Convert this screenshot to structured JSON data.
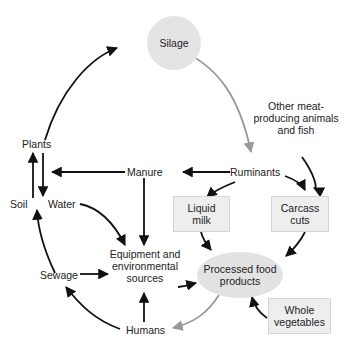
{
  "nodes": {
    "silage": "Silage",
    "other_animals": "Other meat-\nproducing animals\nand fish",
    "plants": "Plants",
    "manure": "Manure",
    "ruminants": "Ruminants",
    "soil": "Soil",
    "water": "Water",
    "liquid_milk": "Liquid\nmilk",
    "carcass_cuts": "Carcass\ncuts",
    "equipment": "Equipment and\nenvironmental\nsources",
    "sewage": "Sewage",
    "processed_food": "Processed food\nproducts",
    "whole_vegetables": "Whole\nvegetables",
    "humans": "Humans"
  },
  "colors": {
    "arrow_dark": "#111111",
    "arrow_gray": "#999999",
    "node_fill": "#e4e4e4",
    "box_fill": "#eeeeee"
  },
  "edges": [
    {
      "from": "Plants",
      "to": "Silage",
      "style": "dark"
    },
    {
      "from": "Silage",
      "to": "Ruminants",
      "style": "gray"
    },
    {
      "from": "Other meat-producing animals and fish",
      "to": "Carcass cuts",
      "style": "dark"
    },
    {
      "from": "Ruminants",
      "to": "Manure",
      "style": "dark"
    },
    {
      "from": "Manure",
      "to": "Plants",
      "style": "dark"
    },
    {
      "from": "Ruminants",
      "to": "Liquid milk",
      "style": "dark"
    },
    {
      "from": "Ruminants",
      "to": "Carcass cuts",
      "style": "dark"
    },
    {
      "from": "Soil",
      "to": "Plants",
      "style": "dark"
    },
    {
      "from": "Plants",
      "to": "Water",
      "style": "dark"
    },
    {
      "from": "Water",
      "to": "Equipment and environmental sources",
      "style": "dark"
    },
    {
      "from": "Manure",
      "to": "Equipment and environmental sources",
      "style": "dark"
    },
    {
      "from": "Sewage",
      "to": "Soil",
      "style": "dark"
    },
    {
      "from": "Sewage",
      "to": "Equipment and environmental sources",
      "style": "dark"
    },
    {
      "from": "Humans",
      "to": "Sewage",
      "style": "dark"
    },
    {
      "from": "Humans",
      "to": "Equipment and environmental sources",
      "style": "dark"
    },
    {
      "from": "Equipment and environmental sources",
      "to": "Processed food products",
      "style": "dark"
    },
    {
      "from": "Liquid milk",
      "to": "Processed food products",
      "style": "dark"
    },
    {
      "from": "Carcass cuts",
      "to": "Processed food products",
      "style": "dark"
    },
    {
      "from": "Whole vegetables",
      "to": "Processed food products",
      "style": "dark"
    },
    {
      "from": "Processed food products",
      "to": "Humans",
      "style": "gray"
    }
  ]
}
